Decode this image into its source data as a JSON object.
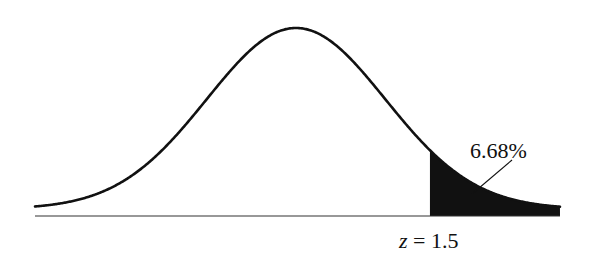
{
  "chart_data": {
    "type": "area",
    "title": "",
    "distribution": "standard normal",
    "mean": 0,
    "sd": 1,
    "shaded_region": {
      "from_z": 1.5,
      "to_z": "infinity",
      "tail": "right"
    },
    "annotations": [
      {
        "text": "6.68%",
        "target": "shaded right tail area"
      },
      {
        "text": "z = 1.5",
        "position": "below axis at shade boundary"
      }
    ],
    "xlabel": "",
    "ylabel": "",
    "grid": false,
    "legend": "none"
  },
  "labels": {
    "area_percent": "6.68%",
    "z_label_var": "z",
    "z_label_rest": " = 1.5"
  },
  "colors": {
    "curve": "#111111",
    "shade": "#111111",
    "axis": "#333333",
    "background": "#ffffff"
  }
}
